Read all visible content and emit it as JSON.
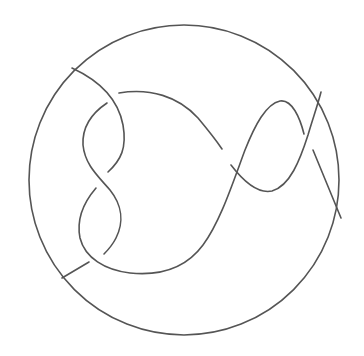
{
  "diagram": {
    "type": "knot-tangle",
    "background": "#ffffff",
    "stroke_color": "#555555",
    "stroke_width": 1.6,
    "boundary": {
      "cx": 184,
      "cy": 180,
      "r": 155
    },
    "strands": [
      {
        "id": "strand-outer-left",
        "d": "M72,68 C98,80 118,98 123,125 C127,148 121,160 108,172"
      },
      {
        "id": "strand-long-main",
        "d": "M96,188 C84,202 76,218 80,238 C85,258 105,270 130,273 C160,276 186,268 203,245 C220,222 232,185 245,150 C255,125 266,104 280,101 C292,99 300,118 304,134"
      },
      {
        "id": "strand-inner-lobe",
        "d": "M107,103 C92,113 82,126 83,145 C85,165 98,176 110,190 C122,205 124,222 116,238 C112,246 108,250 104,254"
      },
      {
        "id": "strand-bottom-left-tail",
        "d": "M62,278 L89,262"
      },
      {
        "id": "strand-top-arc",
        "d": "M119,93 C150,88 178,96 198,118 C208,130 216,140 222,149"
      },
      {
        "id": "strand-right-dip",
        "d": "M231,165 C244,182 258,194 272,191 C290,186 300,160 308,135 C313,118 318,104 321,92"
      },
      {
        "id": "strand-right-tail",
        "d": "M313,150 L341,218"
      }
    ]
  }
}
